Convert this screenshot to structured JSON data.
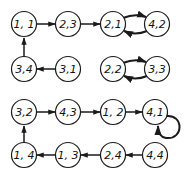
{
  "diagram": {
    "type": "functional-graph",
    "colors": {
      "stroke": "#1a1a1a",
      "background": "#ffffff"
    },
    "nodes": [
      {
        "id": "n11",
        "label": "1, 1",
        "x": 24,
        "y": 24
      },
      {
        "id": "n23",
        "label": "2,3",
        "x": 68,
        "y": 24
      },
      {
        "id": "n21",
        "label": "2,1",
        "x": 113,
        "y": 24
      },
      {
        "id": "n42",
        "label": "4,2",
        "x": 157,
        "y": 24
      },
      {
        "id": "n34",
        "label": "3,4",
        "x": 24,
        "y": 69
      },
      {
        "id": "n31",
        "label": "3,1",
        "x": 68,
        "y": 69
      },
      {
        "id": "n22",
        "label": "2,2",
        "x": 113,
        "y": 69
      },
      {
        "id": "n33",
        "label": "3,3",
        "x": 157,
        "y": 69
      },
      {
        "id": "n32",
        "label": "3,2",
        "x": 24,
        "y": 112
      },
      {
        "id": "n43",
        "label": "4,3",
        "x": 68,
        "y": 112
      },
      {
        "id": "n12",
        "label": "1, 2",
        "x": 113,
        "y": 112
      },
      {
        "id": "n41",
        "label": "4,1",
        "x": 155,
        "y": 112
      },
      {
        "id": "n14",
        "label": "1, 4",
        "x": 24,
        "y": 155
      },
      {
        "id": "n13",
        "label": "1, 3",
        "x": 68,
        "y": 155
      },
      {
        "id": "n24",
        "label": "2,4",
        "x": 113,
        "y": 155
      },
      {
        "id": "n44",
        "label": "4,4",
        "x": 155,
        "y": 155
      }
    ],
    "edges": [
      {
        "from": "1, 1",
        "to": "2,3"
      },
      {
        "from": "2,3",
        "to": "2,1"
      },
      {
        "from": "2,1",
        "to": "4,2"
      },
      {
        "from": "4,2",
        "to": "2,1"
      },
      {
        "from": "3,1",
        "to": "3,4"
      },
      {
        "from": "3,4",
        "to": "1, 1"
      },
      {
        "from": "2,2",
        "to": "3,3"
      },
      {
        "from": "3,3",
        "to": "2,2"
      },
      {
        "from": "3,2",
        "to": "4,3"
      },
      {
        "from": "4,3",
        "to": "1, 2"
      },
      {
        "from": "1, 2",
        "to": "4,1"
      },
      {
        "from": "4,1",
        "to": "4,1",
        "self_loop": true
      },
      {
        "from": "4,4",
        "to": "2,4"
      },
      {
        "from": "2,4",
        "to": "1, 3"
      },
      {
        "from": "1, 3",
        "to": "1, 4"
      },
      {
        "from": "1, 4",
        "to": "3,2"
      }
    ]
  }
}
